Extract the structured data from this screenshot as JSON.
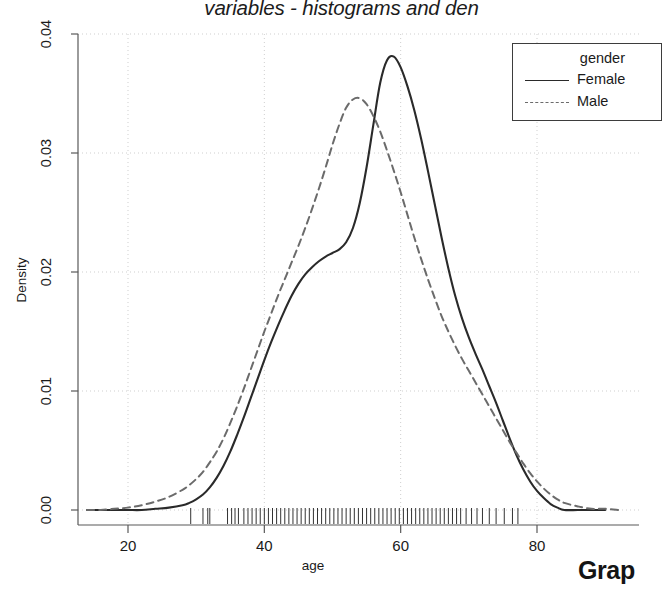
{
  "figure": {
    "title": "variables - histograms and den",
    "corner_label": "Grap"
  },
  "legend": {
    "title": "gender",
    "entries": [
      {
        "label": "Female",
        "style": "solid",
        "color": "#2a2a2a"
      },
      {
        "label": "Male",
        "style": "dashed",
        "color": "#6b6b6b"
      }
    ]
  },
  "chart_data": {
    "type": "line",
    "title": "variables - histograms and den",
    "xlabel": "age",
    "ylabel": "Density",
    "xlim": [
      13.6,
      92.5
    ],
    "ylim": [
      -0.0013,
      0.04
    ],
    "xticks": [
      20,
      40,
      60,
      80
    ],
    "yticks": [
      "0.00",
      "0.01",
      "0.02",
      "0.03",
      "0.04"
    ],
    "ytick_values": [
      0.0,
      0.01,
      0.02,
      0.03,
      0.04
    ],
    "grid": "dotted",
    "legend_position": "top-right",
    "series": [
      {
        "name": "Female",
        "style": "solid",
        "color": "#2a2a2a",
        "x": [
          14,
          16,
          18,
          20,
          22,
          24,
          26,
          28,
          29,
          30,
          31,
          32,
          33,
          34,
          35,
          36,
          37,
          38,
          39,
          40,
          41,
          42,
          43,
          44,
          45,
          46,
          47,
          48,
          49,
          50,
          51,
          52,
          53,
          54,
          55,
          56,
          57,
          58,
          59,
          60,
          61,
          62,
          63,
          64,
          65,
          66,
          67,
          68,
          69,
          70,
          71,
          72,
          73,
          74,
          75,
          76,
          77,
          78,
          79,
          80,
          81,
          82,
          83,
          84,
          86,
          88,
          90
        ],
        "y": [
          0.0,
          0.0,
          0.0,
          0.0,
          0.0,
          0.0001,
          0.0002,
          0.0004,
          0.0006,
          0.0009,
          0.0013,
          0.0019,
          0.0027,
          0.0037,
          0.0049,
          0.0063,
          0.0078,
          0.0094,
          0.011,
          0.0126,
          0.0141,
          0.0155,
          0.0168,
          0.018,
          0.019,
          0.0198,
          0.0204,
          0.0209,
          0.0213,
          0.0216,
          0.0219,
          0.0225,
          0.0237,
          0.0258,
          0.0288,
          0.0324,
          0.0359,
          0.0378,
          0.0381,
          0.0372,
          0.0356,
          0.0336,
          0.0312,
          0.0285,
          0.0257,
          0.0229,
          0.0203,
          0.018,
          0.0161,
          0.0145,
          0.0131,
          0.0118,
          0.0104,
          0.009,
          0.0075,
          0.006,
          0.0046,
          0.0034,
          0.0024,
          0.0016,
          0.001,
          0.0005,
          0.0002,
          0.0,
          0.0,
          0.0,
          0.0
        ]
      },
      {
        "name": "Male",
        "style": "dashed",
        "color": "#6b6b6b",
        "x": [
          14,
          16,
          18,
          20,
          22,
          24,
          26,
          28,
          29,
          30,
          31,
          32,
          33,
          34,
          35,
          36,
          37,
          38,
          39,
          40,
          41,
          42,
          43,
          44,
          45,
          46,
          47,
          48,
          49,
          50,
          51,
          52,
          53,
          54,
          55,
          56,
          57,
          58,
          59,
          60,
          61,
          62,
          63,
          64,
          65,
          66,
          67,
          68,
          69,
          70,
          71,
          72,
          73,
          74,
          75,
          76,
          77,
          78,
          79,
          80,
          81,
          82,
          83,
          84,
          86,
          88,
          90,
          92
        ],
        "y": [
          0.0,
          0.0,
          0.0001,
          0.0002,
          0.0004,
          0.0007,
          0.0011,
          0.0017,
          0.0021,
          0.0026,
          0.0032,
          0.004,
          0.0049,
          0.006,
          0.0073,
          0.0087,
          0.0102,
          0.0118,
          0.0134,
          0.015,
          0.0165,
          0.018,
          0.0194,
          0.0208,
          0.0222,
          0.0237,
          0.0253,
          0.027,
          0.0288,
          0.0307,
          0.0324,
          0.0338,
          0.0345,
          0.0346,
          0.0341,
          0.0331,
          0.0318,
          0.0302,
          0.0285,
          0.0267,
          0.0248,
          0.0229,
          0.0211,
          0.0194,
          0.0178,
          0.0163,
          0.015,
          0.0138,
          0.0127,
          0.0117,
          0.0107,
          0.0097,
          0.0087,
          0.0077,
          0.0067,
          0.0057,
          0.0048,
          0.0039,
          0.0031,
          0.0024,
          0.0018,
          0.0013,
          0.0009,
          0.0006,
          0.0003,
          0.0001,
          0.0001,
          0.0
        ]
      }
    ],
    "rug": {
      "label": "age-rug-ticks",
      "values": [
        29.2,
        31.0,
        31.7,
        32.0,
        34.6,
        35.2,
        35.7,
        36.2,
        37.0,
        37.6,
        38.2,
        38.8,
        39.4,
        40.0,
        40.6,
        41.2,
        41.8,
        42.4,
        43.0,
        43.6,
        44.2,
        44.8,
        45.4,
        46.0,
        46.6,
        47.2,
        47.8,
        48.4,
        49.0,
        49.6,
        50.2,
        50.8,
        51.4,
        52.0,
        52.6,
        53.2,
        53.8,
        54.4,
        55.0,
        55.6,
        56.2,
        56.8,
        57.4,
        58.0,
        58.6,
        59.2,
        59.8,
        60.4,
        61.0,
        61.6,
        62.2,
        62.8,
        63.4,
        64.0,
        64.6,
        65.2,
        65.8,
        66.4,
        67.0,
        67.6,
        68.2,
        68.8,
        69.6,
        70.4,
        71.2,
        72.0,
        73.0,
        74.0,
        75.2,
        76.4,
        77.2
      ]
    }
  }
}
